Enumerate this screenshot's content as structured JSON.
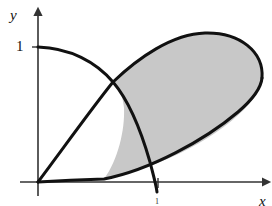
{
  "figure": {
    "background_color": "#ffffff",
    "curve_color": "#111111",
    "axis_color": "#333333",
    "shade_fill_color": "#c8c8c8",
    "axes": {
      "x_label": "x",
      "y_label": "y",
      "origin_px": {
        "x": 38,
        "y": 182
      },
      "x_axis_end_px": {
        "x": 268,
        "y": 182
      },
      "y_axis_end_px": {
        "x": 38,
        "y": 10
      },
      "arrowheads": "both axes"
    },
    "ticks": {
      "y": [
        {
          "label": "1",
          "value": 1,
          "px_y": 47
        }
      ],
      "x": [
        {
          "label": "1",
          "value": 1,
          "px_x": 158
        }
      ]
    },
    "curves": [
      {
        "name": "upper-loop-boundary",
        "description": "Curve rising from the origin through the crossing point and arcing over the top of the shaded loop, returning down the right side",
        "from_px": {
          "x": 38,
          "y": 182
        },
        "to_px": {
          "x": 158,
          "y": 182
        }
      },
      {
        "name": "lower-loop-boundary",
        "description": "Shallow curve leaving the origin along the x-axis then rising to the right tip of the loop",
        "from_px": {
          "x": 38,
          "y": 182
        },
        "to_px": {
          "x": 262,
          "y": 78
        }
      },
      {
        "name": "descending-curve",
        "description": "Curve starting on the y-axis at y = 1 and falling to cross the x-axis at x = 1",
        "from_px": {
          "x": 38,
          "y": 47
        },
        "to_px": {
          "x": 158,
          "y": 190
        }
      }
    ],
    "shaded_region": {
      "name": "shaded-area",
      "fill": "#c8c8c8",
      "description": "Region enclosed between the two loop boundary curves to the right of the descending curve"
    },
    "key_points": {
      "origin": {
        "x": 38,
        "y": 182
      },
      "curve_crossing": {
        "x": 113,
        "y": 82
      },
      "loop_apex": {
        "x": 205,
        "y": 33
      },
      "loop_right_tip": {
        "x": 262,
        "y": 78
      }
    }
  }
}
